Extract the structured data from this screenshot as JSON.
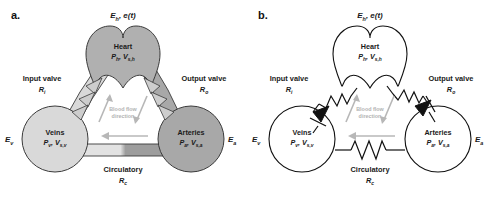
{
  "figure": {
    "panels": [
      {
        "letter": "a.",
        "style": "anatomical",
        "top_param": "E",
        "top_param_sub": "h",
        "top_param_rest": ", e(t)",
        "heart": {
          "name": "Heart",
          "var1": "P",
          "var1_sub": "h",
          "var2": "V",
          "var2_sub": "s,h"
        },
        "veins": {
          "name": "Veins",
          "var1": "P",
          "var1_sub": "v",
          "var2": "V",
          "var2_sub": "s,v"
        },
        "arteries": {
          "name": "Arteries",
          "var1": "P",
          "var1_sub": "a",
          "var2": "V",
          "var2_sub": "s,a"
        },
        "input_valve": {
          "name": "Input valve",
          "r": "R",
          "r_sub": "i"
        },
        "output_valve": {
          "name": "Output valve",
          "r": "R",
          "r_sub": "o"
        },
        "circulatory": {
          "name": "Circulatory",
          "r": "R",
          "r_sub": "c"
        },
        "elastance_left": {
          "e": "E",
          "sub": "v"
        },
        "elastance_right": {
          "e": "E",
          "sub": "a"
        },
        "flow_line1": "Blood flow",
        "flow_line2": "direction"
      },
      {
        "letter": "b.",
        "style": "circuit",
        "top_param": "E",
        "top_param_sub": "h",
        "top_param_rest": ", e(t)",
        "heart": {
          "name": "Heart",
          "var1": "P",
          "var1_sub": "h",
          "var2": "V",
          "var2_sub": "s,h"
        },
        "veins": {
          "name": "Veins",
          "var1": "P",
          "var1_sub": "v",
          "var2": "V",
          "var2_sub": "s,v"
        },
        "arteries": {
          "name": "Arteries",
          "var1": "P",
          "var1_sub": "a",
          "var2": "V",
          "var2_sub": "s,a"
        },
        "input_valve": {
          "name": "Input valve",
          "r": "R",
          "r_sub": "i"
        },
        "output_valve": {
          "name": "Output valve",
          "r": "R",
          "r_sub": "o"
        },
        "circulatory": {
          "name": "Circulatory",
          "r": "R",
          "r_sub": "c"
        },
        "elastance_left": {
          "e": "E",
          "sub": "v"
        },
        "elastance_right": {
          "e": "E",
          "sub": "a"
        },
        "flow_line1": "Blood flow",
        "flow_line2": "direction"
      }
    ],
    "colors": {
      "heart_fill": "#b0b0b0",
      "veins_fill": "#d9d9d9",
      "arteries_fill": "#a8a8a8",
      "vessel_light": "#e0e0e0",
      "vessel_dark": "#9a9a9a",
      "valve_fill": "#cdcdcd",
      "outline": "#3b3b3b",
      "flow_arrow": "#b3b3b3",
      "circuit_stroke": "#111111",
      "background": "#ffffff"
    }
  }
}
